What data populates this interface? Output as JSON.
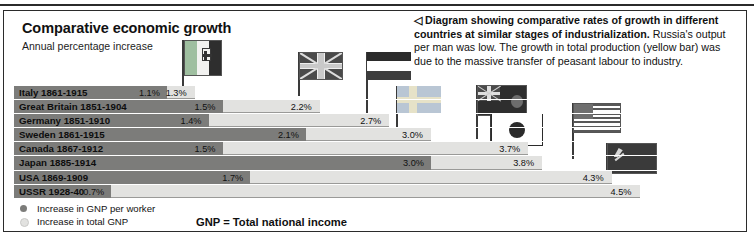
{
  "header": {
    "title": "Comparative economic growth",
    "subtitle": "Annual percentage increase"
  },
  "caption": {
    "marker": "◁",
    "bold_text": "Diagram showing comparative rates of growth in different countries at similar stages of industrialization.",
    "body_text": " Russia's output per man was low. The growth in total production (yellow bar) was due to the massive transfer of peasant labour to industry."
  },
  "legend": {
    "worker_label": "Increase in GNP per worker",
    "total_label": "Increase in total GNP",
    "gnp_note": "GNP = Total national income",
    "worker_color": "#7c7c7a",
    "total_color": "#e2e2e0"
  },
  "chart_data": {
    "type": "bar",
    "title": "Comparative economic growth",
    "subtitle": "Annual percentage increase",
    "xlabel": "",
    "ylabel": "",
    "xlim": [
      0,
      5.0
    ],
    "grid": false,
    "orientation": "horizontal",
    "legend_position": "bottom-left",
    "categories": [
      "Italy 1861-1915",
      "Great Britain 1851-1904",
      "Germany 1851-1910",
      "Sweden 1861-1915",
      "Canada 1867-1912",
      "Japan 1885-1914",
      "USA 1869-1909",
      "USSR 1928-40"
    ],
    "series": [
      {
        "name": "Increase in GNP per worker",
        "color": "#7c7c7a",
        "values": [
          1.1,
          1.5,
          1.4,
          2.1,
          1.5,
          3.0,
          1.7,
          0.7
        ],
        "labels": [
          "1.1%",
          "1.5%",
          "1.4%",
          "2.1%",
          "1.5%",
          "3.0%",
          "1.7%",
          "0.7%"
        ]
      },
      {
        "name": "Increase in total GNP",
        "color": "#e2e2e0",
        "values": [
          1.3,
          2.2,
          2.7,
          3.0,
          3.7,
          3.8,
          4.3,
          4.5
        ],
        "labels": [
          "1.3%",
          "2.2%",
          "2.7%",
          "3.0%",
          "3.7%",
          "3.8%",
          "4.3%",
          "4.5%"
        ]
      }
    ]
  },
  "rows": [
    {
      "label": "Italy 1861-1915",
      "worker_pct": 1.1,
      "total_pct": 1.3,
      "worker_text": "1.1%",
      "total_text": "1.3%"
    },
    {
      "label": "Great Britain 1851-1904",
      "worker_pct": 1.5,
      "total_pct": 2.2,
      "worker_text": "1.5%",
      "total_text": "2.2%"
    },
    {
      "label": "Germany 1851-1910",
      "worker_pct": 1.4,
      "total_pct": 2.7,
      "worker_text": "1.4%",
      "total_text": "2.7%"
    },
    {
      "label": "Sweden 1861-1915",
      "worker_pct": 2.1,
      "total_pct": 3.0,
      "worker_text": "2.1%",
      "total_text": "3.0%"
    },
    {
      "label": "Canada 1867-1912",
      "worker_pct": 1.5,
      "total_pct": 3.7,
      "worker_text": "1.5%",
      "total_text": "3.7%"
    },
    {
      "label": "Japan 1885-1914",
      "worker_pct": 3.0,
      "total_pct": 3.8,
      "worker_text": "3.0%",
      "total_text": "3.8%"
    },
    {
      "label": "USA 1869-1909",
      "worker_pct": 1.7,
      "total_pct": 4.3,
      "worker_text": "1.7%",
      "total_text": "4.3%"
    },
    {
      "label": "USSR 1928-40",
      "worker_pct": 0.7,
      "total_pct": 4.5,
      "worker_text": "0.7%",
      "total_text": "4.5%"
    }
  ],
  "flags": [
    {
      "name": "italy",
      "country": "Italy"
    },
    {
      "name": "great-britain",
      "country": "Great Britain"
    },
    {
      "name": "germany",
      "country": "Germany"
    },
    {
      "name": "sweden",
      "country": "Sweden"
    },
    {
      "name": "canada",
      "country": "Canada"
    },
    {
      "name": "japan",
      "country": "Japan"
    },
    {
      "name": "usa",
      "country": "USA"
    },
    {
      "name": "ussr",
      "country": "USSR"
    }
  ]
}
